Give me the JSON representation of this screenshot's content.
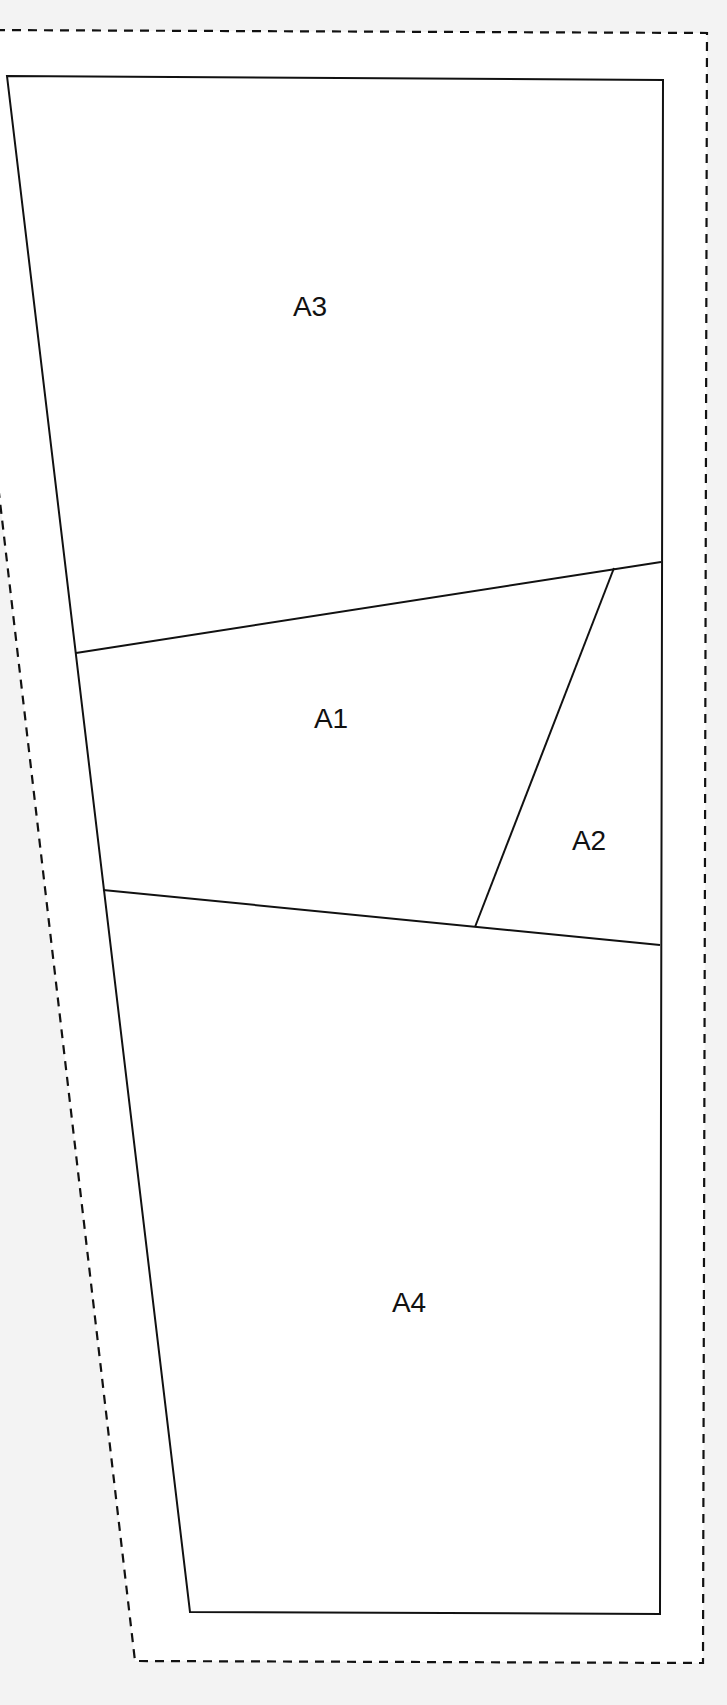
{
  "diagram": {
    "type": "foundation-paper-piecing-pattern",
    "colors": {
      "page_background": "#f3f3f3",
      "seam_allowance_fill": "#ffffff",
      "line_color": "#111111"
    },
    "seam_allowance_outline": {
      "style": "dashed",
      "points": [
        [
          -20,
          30
        ],
        [
          707,
          33
        ],
        [
          703,
          1663
        ],
        [
          135,
          1661
        ],
        [
          -20,
          330
        ]
      ]
    },
    "block_outline": {
      "style": "solid",
      "points": [
        [
          7,
          76
        ],
        [
          663,
          80
        ],
        [
          660,
          1614
        ],
        [
          190,
          1612
        ]
      ]
    },
    "seam_lines": [
      {
        "name": "A3-A1 seam",
        "from": [
          76,
          653
        ],
        "to": [
          661,
          562
        ]
      },
      {
        "name": "A1-A2 seam",
        "from": [
          614,
          568
        ],
        "to": [
          475,
          927
        ]
      },
      {
        "name": "A1-A4 seam",
        "from": [
          103,
          890
        ],
        "to": [
          660,
          945
        ]
      }
    ],
    "sections": [
      {
        "id": "A3",
        "label": "A3",
        "x": 310,
        "y": 307
      },
      {
        "id": "A1",
        "label": "A1",
        "x": 331,
        "y": 719
      },
      {
        "id": "A2",
        "label": "A2",
        "x": 589,
        "y": 841
      },
      {
        "id": "A4",
        "label": "A4",
        "x": 409,
        "y": 1303
      }
    ]
  }
}
